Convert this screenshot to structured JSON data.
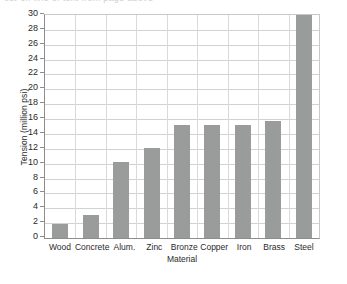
{
  "top_sliver": {
    "text": "cut-off line of text from page above"
  },
  "chart_data": {
    "type": "bar",
    "title": "",
    "subtitle": "",
    "xlabel": "Material",
    "ylabel": "Tension (million psi)",
    "categories": [
      "Wood",
      "Concrete",
      "Alum.",
      "Zinc",
      "Bronze",
      "Copper",
      "Iron",
      "Brass",
      "Steel"
    ],
    "values": [
      1.95,
      3.15,
      10.2,
      12.1,
      15.2,
      15.2,
      15.2,
      15.7,
      30.0
    ],
    "series": [
      {
        "name": "Tension",
        "values": [
          1.95,
          3.15,
          10.2,
          12.1,
          15.2,
          15.2,
          15.2,
          15.7,
          30.0
        ]
      }
    ],
    "ylim": [
      0,
      30
    ],
    "ytick_step": 2,
    "yticks": [
      0,
      2,
      4,
      6,
      8,
      10,
      12,
      14,
      16,
      18,
      20,
      22,
      24,
      26,
      28,
      30
    ],
    "ytick_labels": [
      "0",
      "2",
      "4",
      "6",
      "8",
      "10",
      "12",
      "14",
      "16",
      "18",
      "20",
      "22",
      "24",
      "26",
      "28",
      "30"
    ],
    "grid": true,
    "grid_axis": "y",
    "legend": false,
    "legend_position": "none",
    "annotations": [],
    "colors": {
      "bar": "#9a9c9c",
      "gridline": "#d2d2d2",
      "axis": "#8d8d8d",
      "text": "#2a2a2a",
      "background": "#ffffff"
    }
  }
}
